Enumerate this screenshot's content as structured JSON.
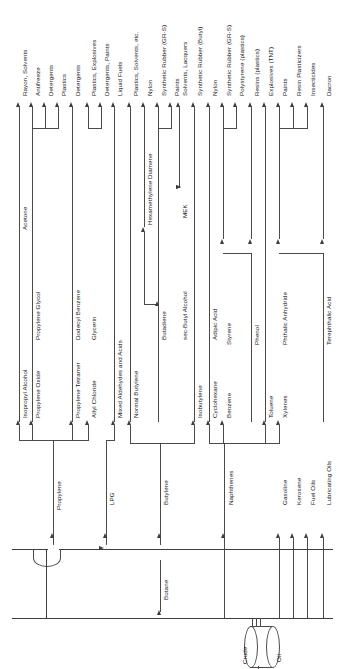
{
  "diagram": {
    "source_vessels": {
      "crude_label_left": "Crude",
      "crude_label_right": "Oil",
      "fractionator": "reboiler-bowl"
    },
    "primary_feeds": [
      {
        "name": "Propylene"
      },
      {
        "name": "LPG"
      },
      {
        "name": "Butane"
      },
      {
        "name": "Butylene"
      },
      {
        "name": "Naphthenes"
      },
      {
        "name": "Gasoline"
      },
      {
        "name": "Kerosene"
      },
      {
        "name": "Fuel Oils"
      },
      {
        "name": "Lubricating Oils"
      }
    ],
    "intermediates": [
      {
        "name": "Isopropyl Alcohol"
      },
      {
        "name": "Propylene Oxide"
      },
      {
        "name": "Propylene Tetramer"
      },
      {
        "name": "Allyl Chloride"
      },
      {
        "name": "Mixed Aldehydes and Acids"
      },
      {
        "name": "Normal Butylene"
      },
      {
        "name": "Butadiene"
      },
      {
        "name": "Isobutylene"
      },
      {
        "name": "sec-Butyl Alcohol"
      },
      {
        "name": "Cyclohexane"
      },
      {
        "name": "Adipic Acid"
      },
      {
        "name": "Benzene"
      },
      {
        "name": "Styrene"
      },
      {
        "name": "Phenol"
      },
      {
        "name": "Toluene"
      },
      {
        "name": "Xylenes"
      },
      {
        "name": "Phthalic Anhydride"
      },
      {
        "name": "Terephthalic Acid"
      }
    ],
    "second_stage": [
      {
        "name": "Acetone"
      },
      {
        "name": "Propylene Glycol"
      },
      {
        "name": "Dodecyl Benzene"
      },
      {
        "name": "Glycerin"
      },
      {
        "name": "Hexamethylene Diamene"
      },
      {
        "name": "MEK"
      }
    ],
    "products": [
      {
        "name": "Rayon, Solvents"
      },
      {
        "name": "Antifreeze"
      },
      {
        "name": "Detergents"
      },
      {
        "name": "Plastics"
      },
      {
        "name": "Detergents"
      },
      {
        "name": "Plastics, Explosives"
      },
      {
        "name": "Detergents, Paints"
      },
      {
        "name": "Liquid Fuels"
      },
      {
        "name": "Plastics, Solvents, etc."
      },
      {
        "name": "Nylon"
      },
      {
        "name": "Synthetic Rubber (GR-S)"
      },
      {
        "name": "Paints"
      },
      {
        "name": "Solvents, Lacquers"
      },
      {
        "name": "Synthetic Rubber (Butyl)"
      },
      {
        "name": "Nylon"
      },
      {
        "name": "Synthetic Rubber (GR-S)"
      },
      {
        "name": "Polystyrene (plastics)"
      },
      {
        "name": "Resins (plastics)"
      },
      {
        "name": "Explosives (TNT)"
      },
      {
        "name": "Paints"
      },
      {
        "name": "Resin Plasticizers"
      },
      {
        "name": "Insecticides"
      },
      {
        "name": "Dacron"
      }
    ]
  }
}
